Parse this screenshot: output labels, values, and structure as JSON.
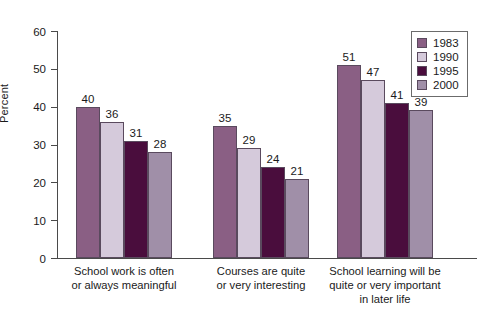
{
  "chart_data": {
    "type": "bar",
    "title": "",
    "xlabel": "",
    "ylabel": "Percent",
    "ylim": [
      0,
      60
    ],
    "ytick_step": 10,
    "yticks": [
      60,
      50,
      40,
      30,
      20,
      10,
      0
    ],
    "grid": false,
    "legend_position": "top-right",
    "categories": [
      "School work is often or always meaningful",
      "Courses are quite or very interesting",
      "School learning will be quite or very important in later life"
    ],
    "category_lines": [
      [
        "School work is often",
        "or always meaningful"
      ],
      [
        "Courses are quite",
        "or very interesting"
      ],
      [
        "School learning will be",
        "quite or very important",
        "in later life"
      ]
    ],
    "series": [
      {
        "name": "1983",
        "color": "#8a5f84",
        "values": [
          40,
          35,
          51
        ]
      },
      {
        "name": "1990",
        "color": "#d5cadb",
        "values": [
          36,
          29,
          47
        ]
      },
      {
        "name": "1995",
        "color": "#4a0d3d",
        "values": [
          31,
          24,
          41
        ]
      },
      {
        "name": "2000",
        "color": "#a08fa8",
        "values": [
          28,
          21,
          39
        ]
      }
    ]
  }
}
